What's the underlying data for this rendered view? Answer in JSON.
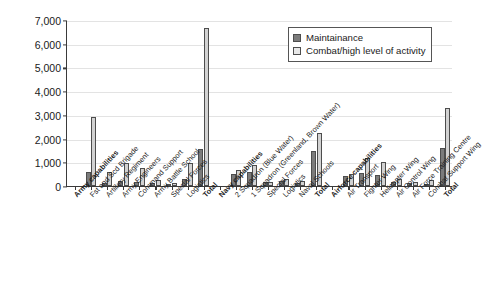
{
  "chart_data": {
    "type": "bar",
    "title": "",
    "xlabel": "",
    "ylabel": "Million DKK",
    "ylim": [
      0,
      7000
    ],
    "ytick_values": [
      0,
      1000,
      2000,
      3000,
      4000,
      5000,
      6000,
      7000
    ],
    "ytick_labels": [
      "0",
      "1,000",
      "2,000",
      "3,000",
      "4,000",
      "5,000",
      "6,000",
      "7,000"
    ],
    "grid": true,
    "legend_position": "top-right",
    "categories": [
      "Army capabilities",
      "Fst and Scd Brigade",
      "Artillery Regiment",
      "Army Engineers",
      "Command Support",
      "Army Battle School",
      "Special Forces",
      "Logistics",
      "Total",
      "Navy capabilities",
      "2 Squadron (Blue Water)",
      "1 Squadron (Greenland, Brown Water)",
      "Special Forces",
      "Logistics",
      "Naval Schools",
      "Total",
      "Airforce capabilities",
      "Air Transport",
      "Fighter Wing",
      "Helicopter Wing",
      "Air Control Wing",
      "Air Force Training Centre",
      "Combat Support Wing",
      "Total"
    ],
    "category_is_header": [
      true,
      false,
      false,
      false,
      false,
      false,
      false,
      false,
      true,
      true,
      false,
      false,
      false,
      false,
      false,
      true,
      true,
      false,
      false,
      false,
      false,
      false,
      false,
      true
    ],
    "series": [
      {
        "name": "Maintainance",
        "color": "#7b7b7b",
        "values": [
          null,
          600,
          120,
          230,
          160,
          130,
          80,
          300,
          1560,
          null,
          490,
          570,
          150,
          200,
          110,
          1470,
          null,
          430,
          560,
          460,
          190,
          110,
          60,
          1610
        ]
      },
      {
        "name": "Combat/high level of activity",
        "color": "#d2d2d2",
        "values": [
          null,
          2900,
          600,
          960,
          740,
          270,
          110,
          990,
          6650,
          null,
          680,
          880,
          170,
          300,
          200,
          2230,
          null,
          520,
          1180,
          1000,
          290,
          150,
          270,
          3300
        ]
      }
    ]
  },
  "legend": {
    "items": [
      {
        "label": "Maintainance",
        "swatch": "maint"
      },
      {
        "label": "Combat/high level of activity",
        "swatch": "combat"
      }
    ]
  }
}
